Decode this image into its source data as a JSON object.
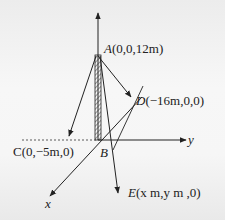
{
  "diagram": {
    "points": {
      "A": {
        "name": "A",
        "coords": "(0,0,12m)"
      },
      "B": {
        "name": "B"
      },
      "C": {
        "name": "C",
        "coords": "(0,−5m,0)"
      },
      "D": {
        "name": "D",
        "coords": "(−16m,0,0)"
      },
      "E": {
        "name": "E",
        "coords": "(x m,y m ,0)"
      }
    },
    "axes": {
      "x": "x",
      "y": "y",
      "z": ""
    },
    "colors": {
      "line": "#222222",
      "background": "#f4f4f4"
    }
  }
}
